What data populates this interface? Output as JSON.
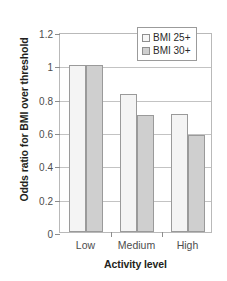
{
  "chart_data": {
    "type": "bar",
    "title": "",
    "subtitle": "",
    "xlabel": "Activity level",
    "ylabel": "Odds ratio for BMI over threshold",
    "categories": [
      "Low",
      "Medium",
      "High"
    ],
    "series": [
      {
        "name": "BMI 25+",
        "values": [
          1.0,
          0.83,
          0.71
        ],
        "color": "#f4f4f4"
      },
      {
        "name": "BMI 30+",
        "values": [
          1.0,
          0.7,
          0.58
        ],
        "color": "#cfcfcf"
      }
    ],
    "ylim": [
      0,
      1.2
    ],
    "yticks": [
      0,
      0.2,
      0.4,
      0.6,
      0.8,
      1,
      1.2
    ],
    "ytick_labels": [
      "0",
      "0.2",
      "0.4",
      "0.6",
      "0.8",
      "1",
      "1.2"
    ],
    "grid": true,
    "grid_axis": "y",
    "legend_position": "top-right",
    "legend_entries": [
      "BMI 25+",
      "BMI 30+"
    ]
  },
  "legend": {
    "items": [
      {
        "label": "BMI 25+",
        "swatch": "light-gray-swatch"
      },
      {
        "label": "BMI 30+",
        "swatch": "dark-gray-swatch"
      }
    ]
  },
  "axes": {
    "y_title": "Odds ratio for BMI over threshold",
    "x_title": "Activity level"
  }
}
